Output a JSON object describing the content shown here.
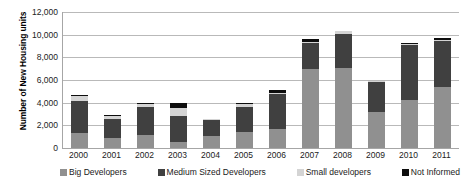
{
  "chart_data": {
    "type": "bar",
    "subtype": "stacked-column",
    "title": "",
    "xlabel": "",
    "ylabel": "Number of New Housing units",
    "ylim": [
      0,
      12000
    ],
    "ytick_step": 2000,
    "ytick_labels": [
      "12,000",
      "10,000",
      "8,000",
      "6,000",
      "4,000",
      "2,000",
      "0"
    ],
    "ytick_values": [
      12000,
      10000,
      8000,
      6000,
      4000,
      2000,
      0
    ],
    "grid": true,
    "legend_position": "bottom",
    "categories": [
      "2000",
      "2001",
      "2002",
      "2003",
      "2004",
      "2005",
      "2006",
      "2007",
      "2008",
      "2009",
      "2010",
      "2011"
    ],
    "series": [
      {
        "name": "Big Developers",
        "color": "#909090",
        "values": [
          1300,
          900,
          1150,
          500,
          1100,
          1450,
          1650,
          6950,
          7050,
          3150,
          4250,
          5350
        ]
      },
      {
        "name": "Medium Sized Developers",
        "color": "#404040",
        "values": [
          2850,
          1700,
          2450,
          2350,
          1350,
          2200,
          3150,
          2300,
          3000,
          2700,
          4800,
          4050
        ]
      },
      {
        "name": "Small developers",
        "color": "#d4d4d4",
        "values": [
          400,
          250,
          300,
          700,
          100,
          250,
          100,
          100,
          300,
          100,
          100,
          100
        ]
      },
      {
        "name": "Not Informed",
        "color": "#0d0d0d",
        "values": [
          100,
          100,
          100,
          450,
          0,
          100,
          200,
          250,
          0,
          0,
          100,
          200
        ]
      }
    ],
    "totals": [
      4650,
      2950,
      4000,
      4000,
      2550,
      4000,
      5100,
      9600,
      10350,
      5950,
      9250,
      9700
    ]
  },
  "legend": {
    "items": [
      {
        "label": "Big Developers",
        "color": "#909090"
      },
      {
        "label": "Medium Sized Developers",
        "color": "#404040"
      },
      {
        "label": "Small developers",
        "color": "#d4d4d4"
      },
      {
        "label": "Not Informed",
        "color": "#0d0d0d"
      }
    ]
  }
}
